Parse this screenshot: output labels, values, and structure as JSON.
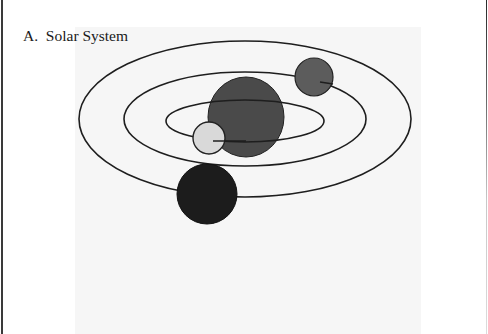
{
  "figure": {
    "title": "A.  Solar System",
    "colors": {
      "background": "#ffffff",
      "panel": "#f6f6f6",
      "orbit_stroke": "#1e1e1e",
      "sun": "#4a4a4a",
      "planet_inner": "#d9d9d9",
      "planet_middle": "#5c5c5c",
      "planet_outer": "#1c1c1c"
    },
    "orbits": [
      {
        "name": "inner-orbit",
        "cx": 245,
        "cy": 121,
        "rx": 79,
        "ry": 21
      },
      {
        "name": "middle-orbit",
        "cx": 245,
        "cy": 119,
        "rx": 121,
        "ry": 47
      },
      {
        "name": "outer-orbit",
        "cx": 245,
        "cy": 119,
        "rx": 166,
        "ry": 78
      }
    ],
    "bodies": [
      {
        "name": "sun",
        "cx": 246,
        "cy": 117,
        "rx": 38,
        "ry": 40
      },
      {
        "name": "inner-planet",
        "cx": 209,
        "cy": 138,
        "r": 16
      },
      {
        "name": "middle-planet",
        "cx": 314,
        "cy": 77,
        "r": 19
      },
      {
        "name": "outer-planet",
        "cx": 207,
        "cy": 194,
        "r": 30
      }
    ]
  }
}
